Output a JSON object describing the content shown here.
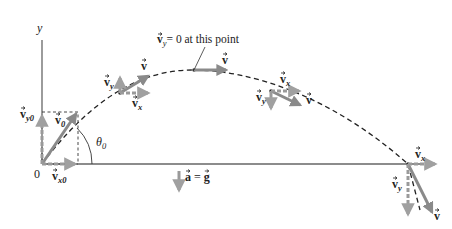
{
  "diagram": {
    "axes": {
      "x_label": "x",
      "y_label": "y",
      "origin_label": "0"
    },
    "annotations": {
      "apex_note": "= 0 at this point",
      "apex_note_vector": "v",
      "apex_note_sub": "y",
      "angle_label": "θ",
      "angle_sub": "0",
      "accel_label": "a = g",
      "accel_lhs": "a",
      "accel_eq": " = ",
      "accel_rhs": "g"
    },
    "vectors": {
      "v0": {
        "sym": "v",
        "sub": "0"
      },
      "vx0": {
        "sym": "v",
        "sub": "x0"
      },
      "vy0": {
        "sym": "v",
        "sub": "y0"
      },
      "v": {
        "sym": "v",
        "sub": ""
      },
      "vx": {
        "sym": "v",
        "sub": "x"
      },
      "vy": {
        "sym": "v",
        "sub": "y"
      }
    },
    "points": [
      {
        "name": "launch",
        "label_set": [
          "v0",
          "vx0",
          "vy0"
        ]
      },
      {
        "name": "rising",
        "label_set": [
          "v",
          "vx",
          "vy"
        ]
      },
      {
        "name": "apex",
        "label_set": [
          "v"
        ]
      },
      {
        "name": "descending",
        "label_set": [
          "v",
          "vx",
          "vy"
        ]
      },
      {
        "name": "landing",
        "label_set": [
          "v",
          "vx",
          "vy"
        ]
      }
    ],
    "colors": {
      "vector_fill": "#8a8a8a",
      "component_fill": "#9a9a9a",
      "axis": "#555555",
      "trajectory": "#222222",
      "text": "#222222"
    }
  }
}
